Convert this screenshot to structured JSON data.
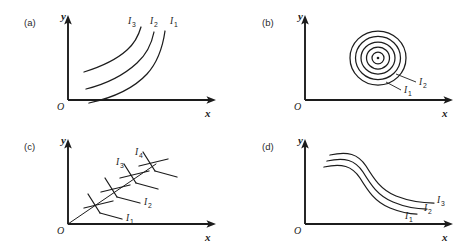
{
  "figure": {
    "background_color": "#ffffff",
    "ink_color": "#1c1c1c",
    "panel_count": 4
  },
  "panels": [
    {
      "tag": "(a)",
      "x_axis_label": "x",
      "y_axis_label": "y",
      "origin_label": "O",
      "kind": "increasing-convex-curves",
      "curve_labels": [
        {
          "base": "I",
          "sub": "3"
        },
        {
          "base": "I",
          "sub": "2"
        },
        {
          "base": "I",
          "sub": "1"
        }
      ]
    },
    {
      "tag": "(b)",
      "x_axis_label": "x",
      "y_axis_label": "y",
      "origin_label": "O",
      "kind": "concentric-circles",
      "ring_count": 5,
      "has_center_dot": true,
      "curve_labels": [
        {
          "base": "I",
          "sub": "2"
        },
        {
          "base": "I",
          "sub": "1"
        }
      ]
    },
    {
      "tag": "(c)",
      "x_axis_label": "x",
      "y_axis_label": "y",
      "origin_label": "O",
      "kind": "diagonal-ray-with-transverse-segments",
      "segment_count": 4,
      "curve_labels": [
        {
          "base": "I",
          "sub": "1"
        },
        {
          "base": "I",
          "sub": "2"
        },
        {
          "base": "I",
          "sub": "3"
        },
        {
          "base": "I",
          "sub": "4"
        }
      ]
    },
    {
      "tag": "(d)",
      "x_axis_label": "x",
      "y_axis_label": "y",
      "origin_label": "O",
      "kind": "decreasing-sigmoid-curves",
      "curve_labels": [
        {
          "base": "I",
          "sub": "1"
        },
        {
          "base": "I",
          "sub": "2"
        },
        {
          "base": "I",
          "sub": "3"
        }
      ]
    }
  ]
}
